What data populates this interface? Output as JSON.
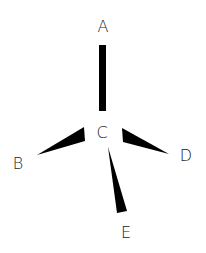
{
  "diagram": {
    "type": "wedge-dash stereochemistry (tetrahedral center)",
    "center": {
      "label": "C"
    },
    "substituents": [
      {
        "label": "A",
        "bond": "plain",
        "direction": "up"
      },
      {
        "label": "B",
        "bond": "wedge",
        "direction": "lower-left"
      },
      {
        "label": "D",
        "bond": "wedge",
        "direction": "lower-right"
      },
      {
        "label": "E",
        "bond": "wedge",
        "direction": "down"
      }
    ],
    "colors": {
      "bond": "#000000",
      "label": "#222222",
      "background": "#ffffff"
    }
  }
}
